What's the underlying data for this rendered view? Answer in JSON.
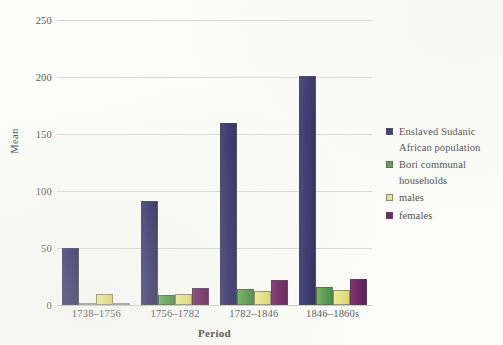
{
  "chart_data": {
    "type": "bar",
    "title": "",
    "xlabel": "Period",
    "ylabel": "Mean",
    "categories": [
      "1738–1756",
      "1756–1782",
      "1782–1846",
      "1846–1860s"
    ],
    "series": [
      {
        "name": "Enslaved Sudanic African population",
        "color": "#2e2a6b",
        "values": [
          50,
          91,
          160,
          201
        ]
      },
      {
        "name": "Bori communal households",
        "color": "#539a48",
        "values": [
          2,
          9,
          14,
          16
        ]
      },
      {
        "name": "males",
        "color": "#e8e484",
        "values": [
          10,
          10,
          12,
          13
        ]
      },
      {
        "name": "females",
        "color": "#6b1f5e",
        "values": [
          1,
          15,
          22,
          23
        ]
      }
    ],
    "ylim": [
      0,
      250
    ],
    "yticks": [
      0,
      50,
      100,
      150,
      200,
      250
    ],
    "ytick_labels": [
      "0",
      "50",
      "100",
      "150",
      "200",
      "250"
    ],
    "grid": "horizontal",
    "legend_position": "right"
  }
}
